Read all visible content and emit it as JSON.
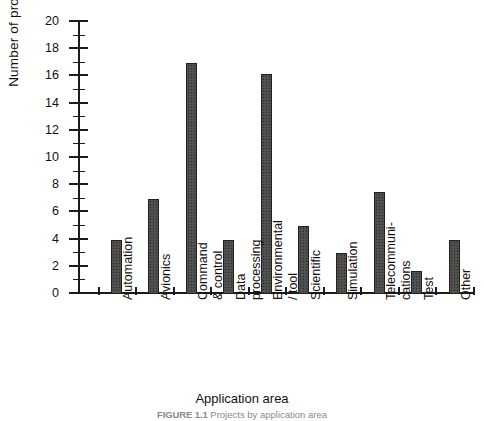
{
  "chart_data": {
    "type": "bar",
    "title": "",
    "xlabel": "Application area",
    "ylabel": "Number of projects",
    "ylim": [
      0,
      20
    ],
    "ytick_step": 2,
    "minor_ticks": true,
    "grid": false,
    "legend": "none",
    "categories": [
      "Automation",
      "Avionics",
      "Command & control",
      "Data processing",
      "Environmental / tool",
      "Scientific",
      "Simulation",
      "Telecommunications",
      "Test",
      "Other"
    ],
    "category_lines": [
      [
        "Automation"
      ],
      [
        "Avionics"
      ],
      [
        "Command",
        "& control"
      ],
      [
        "Data",
        "processing"
      ],
      [
        "Environmental",
        "/ tool"
      ],
      [
        "Scientific"
      ],
      [
        "Simulation"
      ],
      [
        "Telecommuni-",
        "cations"
      ],
      [
        "Test"
      ],
      [
        "Other"
      ]
    ],
    "values": [
      4,
      7,
      17,
      4,
      16.2,
      5,
      3,
      7.5,
      1.7,
      4
    ],
    "ytick_labels": [
      "0",
      "2",
      "4",
      "6",
      "8",
      "10",
      "12",
      "14",
      "16",
      "18",
      "20"
    ],
    "bar_color": "#6d6d6b",
    "bar_edge_color": "#20201f",
    "axis_color": "#1b1b1b"
  },
  "caption": {
    "figure_number": "FIGURE 1.1",
    "text": "Projects by application area"
  }
}
